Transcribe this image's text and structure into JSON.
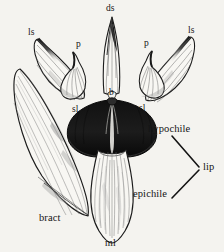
{
  "figure": {
    "kind": "botanical-line-drawing",
    "background_color": "#f4f3ef",
    "ink_color": "#141414",
    "width": 224,
    "height": 252
  },
  "labels": {
    "ds": "ds",
    "ls_left": "ls",
    "ls_right": "ls",
    "p_left": "p",
    "p_right": "p",
    "sl_left": "sl",
    "sl_right": "sl",
    "b": "b",
    "hypochile": "hypochile",
    "epichile": "epichile",
    "lip": "lip",
    "bract": "bract",
    "ml": "ml"
  },
  "parts": [
    {
      "name": "dorsal-sepal",
      "label": "ds",
      "color": "#f7f6f2"
    },
    {
      "name": "lateral-sepal-left",
      "label": "ls",
      "color": "#f7f6f2"
    },
    {
      "name": "lateral-sepal-right",
      "label": "ls",
      "color": "#f7f6f2"
    },
    {
      "name": "petal-left",
      "label": "p",
      "color": "#f7f6f2"
    },
    {
      "name": "petal-right",
      "label": "p",
      "color": "#f7f6f2"
    },
    {
      "name": "stelidium-left",
      "label": "sl",
      "color": "#f7f6f2"
    },
    {
      "name": "stelidium-right",
      "label": "sl",
      "color": "#f7f6f2"
    },
    {
      "name": "column-base",
      "label": "b",
      "color": "#2a2a2a"
    },
    {
      "name": "hypochile",
      "label": "hypochile",
      "color": "#1a1a1a"
    },
    {
      "name": "epichile",
      "label": "epichile",
      "color": "#f7f6f2"
    },
    {
      "name": "midlobe",
      "label": "ml",
      "color": "#f7f6f2"
    },
    {
      "name": "bract",
      "label": "bract",
      "color": "#f7f6f2"
    }
  ]
}
